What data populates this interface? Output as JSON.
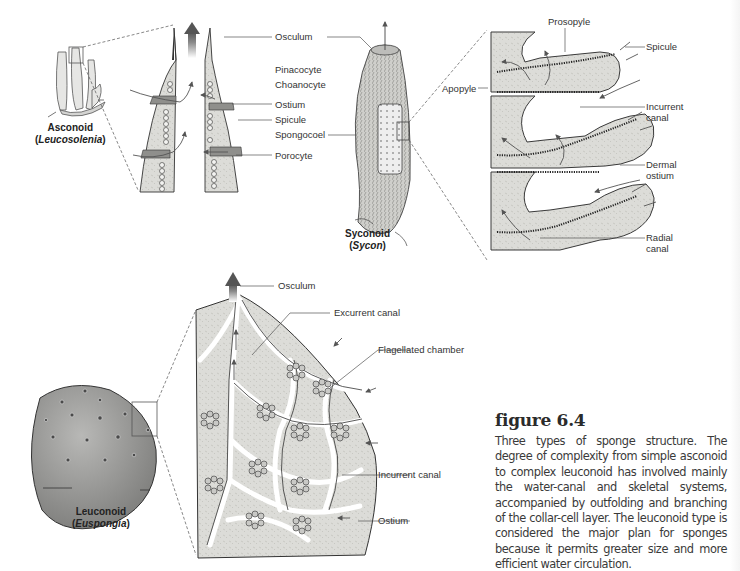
{
  "figure": {
    "number_label": "figure 6.4",
    "caption": "Three types of sponge structure. The degree of complexity from simple asconoid to complex leuconoid has involved mainly the water-canal and skeletal systems, accompanied by outfolding and branching of the collar-cell layer. The leuconoid type is considered the major plan for sponges because it permits greater size and more efficient water circulation."
  },
  "asconoid": {
    "type_name": "Asconoid",
    "genus_open": "(",
    "genus": "Leucosolenia",
    "genus_close": ")",
    "labels": {
      "osculum": "Osculum",
      "pinacocyte": "Pinacocyte",
      "choanocyte": "Choanocyte",
      "ostium": "Ostium",
      "spicule": "Spicule",
      "spongocoel": "Spongocoel",
      "porocyte": "Porocyte"
    }
  },
  "syconoid": {
    "type_name": "Syconoid",
    "genus_open": "(",
    "genus": "Sycon",
    "genus_close": ")",
    "labels": {
      "prosopyle": "Prosopyle",
      "spicule": "Spicule",
      "apopyle": "Apopyle",
      "incurrent_canal_1": "Incurrent",
      "incurrent_canal_2": "canal",
      "dermal_ostium_1": "Dermal",
      "dermal_ostium_2": "ostium",
      "radial_canal_1": "Radial",
      "radial_canal_2": "canal"
    }
  },
  "leuconoid": {
    "type_name": "Leuconoid",
    "genus_open": "(",
    "genus": "Euspongia",
    "genus_close": ")",
    "labels": {
      "osculum": "Osculum",
      "excurrent_canal": "Excurrent canal",
      "flagellated_chamber": "Flagellated chamber",
      "incurrent_canal": "Incurrent canal",
      "ostium": "Ostium"
    }
  },
  "colors": {
    "tissue_fill": "#d9d9d6",
    "tissue_stroke": "#3c3c3c",
    "collar_layer": "#555555",
    "arrow": "#5a5a5a",
    "leader_line": "#555555",
    "sponge_body": "#9a9a98",
    "text": "#333333"
  }
}
